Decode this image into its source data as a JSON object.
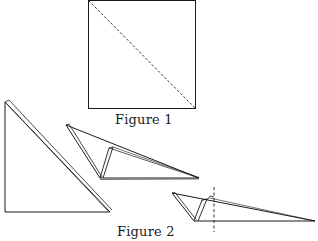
{
  "figure1": {
    "caption": "Figure 1",
    "description": "square sheet with dashed diagonal fold line"
  },
  "figure2": {
    "caption": "Figure 2",
    "description": "three stages of folding the triangle, final with vertical dashed fold line"
  },
  "colors": {
    "stroke": "#1a1a1a",
    "background": "#ffffff"
  }
}
